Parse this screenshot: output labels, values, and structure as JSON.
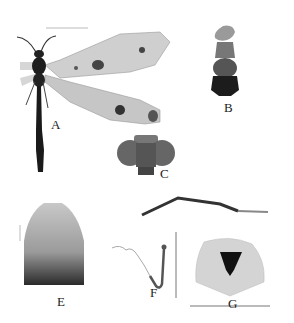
{
  "figure": {
    "panels": [
      {
        "id": "A",
        "label": "A",
        "subject": "adult habitus, dorsal view"
      },
      {
        "id": "B",
        "label": "B",
        "subject": "head and thorax, dorsal view"
      },
      {
        "id": "C",
        "label": "C",
        "subject": "head, frontal view"
      },
      {
        "id": "D",
        "label": "",
        "subject": "leg / appendage"
      },
      {
        "id": "E",
        "label": "E",
        "subject": "sclerite plate"
      },
      {
        "id": "F",
        "label": "F",
        "subject": "hooked structure"
      },
      {
        "id": "G",
        "label": "G",
        "subject": "genitalia, caudal view"
      }
    ],
    "colors": {
      "background": "#ffffff",
      "specimen_dark": "#1a1a1a",
      "specimen_mid": "#8a8a8a",
      "wing": "#c9c9c9",
      "scale_bar": "#777777"
    }
  }
}
